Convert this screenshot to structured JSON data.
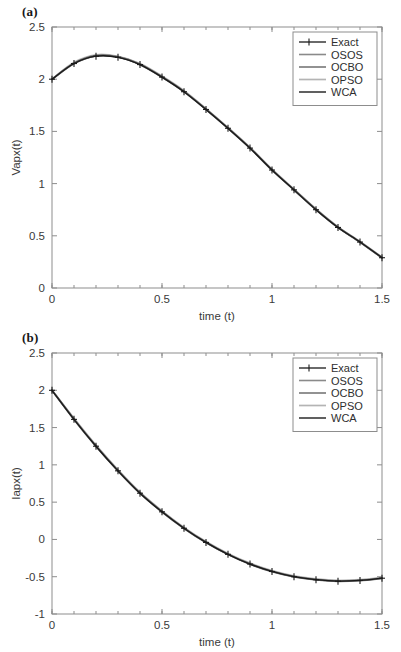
{
  "figure": {
    "panels": [
      {
        "id": "a",
        "panel_label": "(a)"
      },
      {
        "id": "b",
        "panel_label": "(b)"
      }
    ]
  },
  "chart_data": [
    {
      "type": "line",
      "panel_label": "(a)",
      "title": "",
      "xlabel": "time (t)",
      "ylabel": "Vapx(t)",
      "xlim": [
        0,
        1.5
      ],
      "ylim": [
        0,
        2.5
      ],
      "xticks": [
        0,
        0.5,
        1,
        1.5
      ],
      "xtick_labels": [
        "0",
        "0.5",
        "1",
        "1.5"
      ],
      "yticks": [
        0,
        0.5,
        1,
        1.5,
        2,
        2.5
      ],
      "ytick_labels": [
        "0",
        "0.5",
        "1",
        "1.5",
        "2",
        "2.5"
      ],
      "x_minor_count": 4,
      "grid": false,
      "legend_position": "top-right",
      "x": [
        0,
        0.1,
        0.2,
        0.3,
        0.4,
        0.5,
        0.6,
        0.7,
        0.8,
        0.9,
        1.0,
        1.1,
        1.2,
        1.3,
        1.4,
        1.5
      ],
      "series": [
        {
          "name": "Exact",
          "color": "#1a1a1a",
          "width": 1.3,
          "marker": "plus",
          "values": [
            2.0,
            2.15,
            2.22,
            2.21,
            2.14,
            2.02,
            1.88,
            1.71,
            1.53,
            1.34,
            1.13,
            0.94,
            0.75,
            0.58,
            0.44,
            0.29
          ]
        },
        {
          "name": "OSOS",
          "color": "#8a8a8a",
          "width": 1.6,
          "marker": "none",
          "values": [
            2.0,
            2.155,
            2.228,
            2.215,
            2.145,
            2.025,
            1.884,
            1.714,
            1.533,
            1.343,
            1.134,
            0.943,
            0.754,
            0.583,
            0.442,
            0.292
          ]
        },
        {
          "name": "OCBO",
          "color": "#6e6e6e",
          "width": 1.5,
          "marker": "none",
          "values": [
            2.0,
            2.148,
            2.222,
            2.212,
            2.138,
            2.018,
            1.878,
            1.708,
            1.528,
            1.338,
            1.128,
            0.938,
            0.748,
            0.578,
            0.438,
            0.288
          ]
        },
        {
          "name": "OPSO",
          "color": "#b4b4b4",
          "width": 1.7,
          "marker": "none",
          "values": [
            2.0,
            2.162,
            2.234,
            2.219,
            2.15,
            2.03,
            1.89,
            1.718,
            1.537,
            1.347,
            1.138,
            0.947,
            0.757,
            0.586,
            0.446,
            0.296
          ]
        },
        {
          "name": "WCA",
          "color": "#585858",
          "width": 1.9,
          "marker": "none",
          "values": [
            2.0,
            2.152,
            2.225,
            2.214,
            2.142,
            2.022,
            1.882,
            1.712,
            1.531,
            1.341,
            1.131,
            0.941,
            0.752,
            0.581,
            0.441,
            0.291
          ]
        }
      ]
    },
    {
      "type": "line",
      "panel_label": "(b)",
      "title": "",
      "xlabel": "time (t)",
      "ylabel": "Iapx(t)",
      "xlim": [
        0,
        1.5
      ],
      "ylim": [
        -1,
        2.5
      ],
      "xticks": [
        0,
        0.5,
        1,
        1.5
      ],
      "xtick_labels": [
        "0",
        "0.5",
        "1",
        "1.5"
      ],
      "yticks": [
        -1,
        -0.5,
        0,
        0.5,
        1,
        1.5,
        2,
        2.5
      ],
      "ytick_labels": [
        "-1",
        "-0.5",
        "0",
        "0.5",
        "1",
        "1.5",
        "2",
        "2.5"
      ],
      "x_minor_count": 4,
      "grid": false,
      "legend_position": "top-right",
      "x": [
        0,
        0.1,
        0.2,
        0.3,
        0.4,
        0.5,
        0.6,
        0.7,
        0.8,
        0.9,
        1.0,
        1.1,
        1.2,
        1.3,
        1.4,
        1.5
      ],
      "series": [
        {
          "name": "Exact",
          "color": "#1a1a1a",
          "width": 1.3,
          "marker": "plus",
          "values": [
            2.0,
            1.61,
            1.25,
            0.92,
            0.62,
            0.37,
            0.15,
            -0.04,
            -0.2,
            -0.33,
            -0.43,
            -0.5,
            -0.54,
            -0.56,
            -0.55,
            -0.52
          ]
        },
        {
          "name": "OSOS",
          "color": "#8a8a8a",
          "width": 1.6,
          "marker": "none",
          "values": [
            2.0,
            1.618,
            1.258,
            0.928,
            0.628,
            0.378,
            0.156,
            -0.034,
            -0.194,
            -0.324,
            -0.424,
            -0.494,
            -0.534,
            -0.554,
            -0.544,
            -0.514
          ]
        },
        {
          "name": "OCBO",
          "color": "#6e6e6e",
          "width": 1.5,
          "marker": "none",
          "values": [
            2.0,
            1.606,
            1.246,
            0.916,
            0.616,
            0.366,
            0.146,
            -0.044,
            -0.204,
            -0.334,
            -0.434,
            -0.504,
            -0.544,
            -0.564,
            -0.554,
            -0.524
          ]
        },
        {
          "name": "OPSO",
          "color": "#b4b4b4",
          "width": 1.7,
          "marker": "none",
          "values": [
            2.0,
            1.624,
            1.264,
            0.934,
            0.634,
            0.384,
            0.162,
            -0.028,
            -0.188,
            -0.318,
            -0.418,
            -0.488,
            -0.528,
            -0.548,
            -0.538,
            -0.508
          ]
        },
        {
          "name": "WCA",
          "color": "#585858",
          "width": 1.9,
          "marker": "none",
          "values": [
            2.0,
            1.612,
            1.252,
            0.922,
            0.622,
            0.372,
            0.151,
            -0.039,
            -0.199,
            -0.329,
            -0.429,
            -0.499,
            -0.539,
            -0.559,
            -0.549,
            -0.519
          ]
        }
      ]
    }
  ]
}
